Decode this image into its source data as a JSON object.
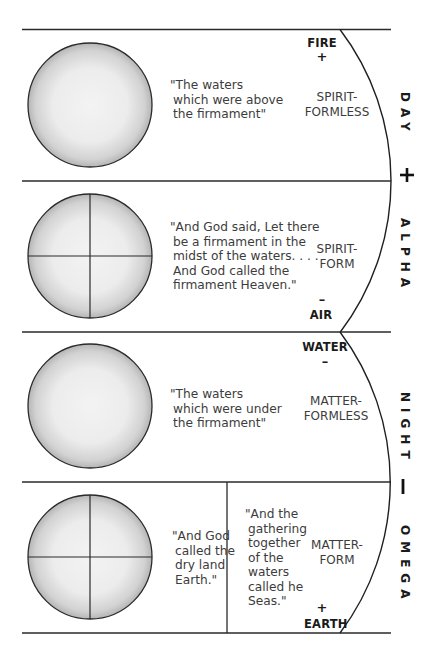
{
  "diagram": {
    "rows": [
      {
        "id": "day",
        "side_label": "DAY",
        "circle": {
          "crosshair": false
        },
        "quote_lines": [
          "\"The waters",
          "which were above",
          "the firmament\""
        ],
        "category_lines": [
          "SPIRIT-",
          "FORMLESS"
        ],
        "element": {
          "name": "FIRE",
          "sign": "+",
          "position": "top"
        }
      },
      {
        "id": "alpha",
        "side_label": "ALPHA",
        "circle": {
          "crosshair": true
        },
        "quote_lines": [
          "\"And God said, Let there",
          "be a firmament in the",
          "midst of the waters. . . .",
          "And God called the",
          "firmament Heaven.\""
        ],
        "category_lines": [
          "SPIRIT-",
          "FORM"
        ],
        "element": {
          "name": "AIR",
          "sign": "–",
          "position": "bottom"
        }
      },
      {
        "id": "night",
        "side_label": "NIGHT",
        "circle": {
          "crosshair": false
        },
        "quote_lines": [
          "\"The waters",
          "which were under",
          "the firmament\""
        ],
        "category_lines": [
          "MATTER-",
          "FORMLESS"
        ],
        "element": {
          "name": "WATER",
          "sign": "–",
          "position": "top"
        }
      },
      {
        "id": "omega",
        "side_label": "OMEGA",
        "circle": {
          "crosshair": true
        },
        "quote_lines": [
          "\"And God",
          "called the",
          "dry land",
          "Earth.\""
        ],
        "quote2_lines": [
          "\"And the",
          "gathering",
          "together",
          "of the",
          "waters",
          "called he",
          "Seas.\""
        ],
        "category_lines": [
          "MATTER-",
          "FORM"
        ],
        "element": {
          "name": "EARTH",
          "sign": "+",
          "position": "bottom"
        }
      }
    ],
    "polarity_signs": {
      "upper": "+",
      "lower": "|"
    },
    "colors": {
      "line": "#2a2a2a",
      "circle_fill_center": "#f2f2f2",
      "circle_fill_edge": "#bdbdbd",
      "text": "#3c3c3c",
      "bold_text": "#1a1a1a"
    }
  }
}
